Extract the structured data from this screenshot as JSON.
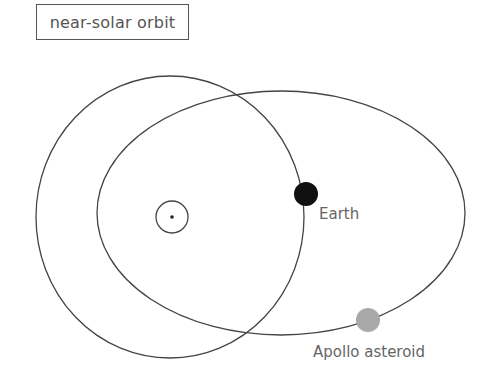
{
  "title": "near-solar orbit",
  "labels": {
    "earth": "Earth",
    "asteroid": "Apollo asteroid"
  },
  "elements": {
    "sun": "sun-symbol",
    "earth_orbit": "earth-orbit",
    "asteroid_orbit": "apollo-asteroid-orbit"
  },
  "colors": {
    "line": "#444444",
    "earth": "#111111",
    "asteroid": "#a8a8a8",
    "text": "#666666"
  }
}
